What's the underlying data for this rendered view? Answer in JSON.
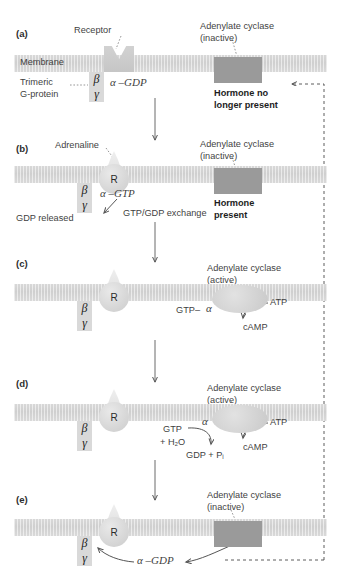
{
  "figure": {
    "colors": {
      "membrane": "#d3d3d3",
      "cyclase_inactive": "#9a9a9a",
      "cyclase_active": "#d6d6d6",
      "receptor": "#dcdcdc",
      "chip": "#d9d9d9",
      "text": "#3f3f3f",
      "bold_text": "#1d1d1d"
    },
    "panels": [
      {
        "id": "(a)",
        "labels": {
          "receptor": "Receptor",
          "membrane": "Membrane",
          "trimeric": "Trimeric",
          "gprotein": "G-protein",
          "beta": "β",
          "gamma": "γ",
          "alpha_gdp": "α –GDP",
          "cyclase_line1": "Adenylate cyclase",
          "cyclase_line2": "(inactive)",
          "hormone_line1": "Hormone no",
          "hormone_line2": "longer present"
        }
      },
      {
        "id": "(b)",
        "labels": {
          "adrenaline": "Adrenaline",
          "receptor_letter": "R",
          "beta": "β",
          "gamma": "γ",
          "alpha_gtp": "α –GTP",
          "gdp_released": "GDP released",
          "exchange": "GTP/GDP exchange",
          "cyclase_line1": "Adenylate cyclase",
          "cyclase_line2": "(inactive)",
          "hormone_line1": "Hormone",
          "hormone_line2": "present"
        }
      },
      {
        "id": "(c)",
        "labels": {
          "receptor_letter": "R",
          "beta": "β",
          "gamma": "γ",
          "gtp_alpha": "GTP–",
          "alpha": "α",
          "cyclase_line1": "Adenylate cyclase",
          "cyclase_line2": "(active)",
          "atp": "ATP",
          "camp": "cAMP"
        }
      },
      {
        "id": "(d)",
        "labels": {
          "receptor_letter": "R",
          "beta": "β",
          "gamma": "γ",
          "alpha": "α",
          "gtp": "GTP",
          "water": "+ H₂O",
          "gdp_pi": "GDP + Pᵢ",
          "cyclase_line1": "Adenylate cyclase",
          "cyclase_line2": "(active)",
          "atp": "ATP",
          "camp": "cAMP"
        }
      },
      {
        "id": "(e)",
        "labels": {
          "receptor_letter": "R",
          "beta": "β",
          "gamma": "γ",
          "alpha_gdp": "α –GDP",
          "cyclase_line1": "Adenylate cyclase",
          "cyclase_line2": "(inactive)"
        }
      }
    ]
  }
}
